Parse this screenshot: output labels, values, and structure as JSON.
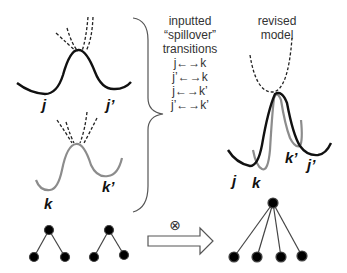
{
  "top_left_potential": {
    "labels": {
      "left": "j",
      "right": "j’"
    }
  },
  "bottom_left_potential": {
    "labels": {
      "left": "k",
      "right": "k’"
    }
  },
  "transitions_box": {
    "title_line1": "inputted",
    "title_line2": "“spillover”",
    "title_line3": "transitions",
    "items": [
      "j←→k",
      "j’←→k",
      "j←→k’",
      "j’←→k’"
    ]
  },
  "revised_model": {
    "title_line1": "revised",
    "title_line2": "model",
    "labels": {
      "j": "j",
      "k": "k",
      "k_prime": "k’",
      "j_prime": "j’"
    }
  },
  "operator": {
    "symbol": "⊗"
  },
  "colors": {
    "black_curve": "#111111",
    "gray_curve": "#8c8c8c",
    "text": "#333333"
  }
}
